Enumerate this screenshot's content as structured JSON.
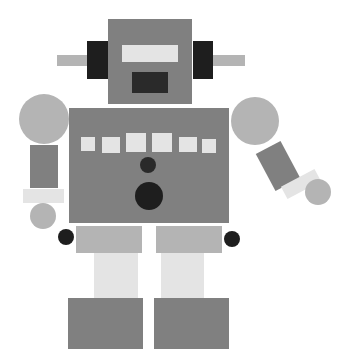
{
  "scene": {
    "subject": "robot",
    "background": "#ffffff",
    "colors": {
      "dark_gray": "#808080",
      "mid_gray": "#b4b4b4",
      "light_gray": "#e4e4e4",
      "black": "#1e1e1e"
    }
  },
  "shapes": {
    "antenna_left": {
      "x": 57,
      "y": 55,
      "w": 31,
      "h": 11,
      "color": "#b4b4b4"
    },
    "antenna_right": {
      "x": 212,
      "y": 55,
      "w": 33,
      "h": 11,
      "color": "#b4b4b4"
    },
    "ear_left": {
      "x": 87,
      "y": 41,
      "w": 21,
      "h": 38,
      "color": "#1e1e1e"
    },
    "ear_right": {
      "x": 193,
      "y": 41,
      "w": 20,
      "h": 38,
      "color": "#1e1e1e"
    },
    "head": {
      "x": 108,
      "y": 19,
      "w": 84,
      "h": 85,
      "color": "#808080"
    },
    "eye_visor": {
      "x": 122,
      "y": 45,
      "w": 56,
      "h": 17,
      "color": "#e4e4e4"
    },
    "mouth": {
      "x": 132,
      "y": 72,
      "w": 36,
      "h": 21,
      "color": "#2a2a2a"
    },
    "body": {
      "x": 69,
      "y": 108,
      "w": 160,
      "h": 115,
      "color": "#808080"
    },
    "buttons": [
      {
        "x": 81,
        "y": 137,
        "w": 14,
        "h": 14,
        "color": "#e4e4e4"
      },
      {
        "x": 102,
        "y": 137,
        "w": 18,
        "h": 16,
        "color": "#e4e4e4"
      },
      {
        "x": 126,
        "y": 133,
        "w": 20,
        "h": 19,
        "color": "#e4e4e4"
      },
      {
        "x": 152,
        "y": 133,
        "w": 20,
        "h": 19,
        "color": "#e4e4e4"
      },
      {
        "x": 179,
        "y": 137,
        "w": 18,
        "h": 15,
        "color": "#e4e4e4"
      },
      {
        "x": 202,
        "y": 139,
        "w": 14,
        "h": 14,
        "color": "#e4e4e4"
      }
    ],
    "chest_dot_small": {
      "cx": 148,
      "cy": 165,
      "r": 8,
      "color": "#2a2a2a"
    },
    "chest_dot_large": {
      "cx": 149,
      "cy": 196,
      "r": 14,
      "color": "#1e1e1e"
    },
    "shoulder_left": {
      "cx": 44,
      "cy": 119,
      "r": 25,
      "color": "#b4b4b4"
    },
    "arm_left": {
      "x": 30,
      "y": 145,
      "w": 28,
      "h": 43,
      "color": "#808080"
    },
    "wrist_left": {
      "x": 23,
      "y": 189,
      "w": 41,
      "h": 14,
      "color": "#e4e4e4"
    },
    "hand_left": {
      "cx": 43,
      "cy": 216,
      "r": 13,
      "color": "#b4b4b4"
    },
    "shoulder_right": {
      "cx": 255,
      "cy": 121,
      "r": 24,
      "color": "#b4b4b4"
    },
    "arm_right": {
      "cx": 278,
      "cy": 166,
      "w": 28,
      "h": 42,
      "rotate": -28,
      "color": "#808080"
    },
    "wrist_right": {
      "cx": 301,
      "cy": 184,
      "w": 38,
      "h": 14,
      "rotate": -28,
      "color": "#e4e4e4"
    },
    "hand_right": {
      "cx": 318,
      "cy": 192,
      "r": 13,
      "color": "#b4b4b4"
    },
    "knee_left": {
      "cx": 66,
      "cy": 237,
      "r": 8,
      "color": "#1e1e1e"
    },
    "knee_right": {
      "cx": 232,
      "cy": 239,
      "r": 8,
      "color": "#1e1e1e"
    },
    "thigh_left": {
      "x": 76,
      "y": 226,
      "w": 66,
      "h": 27,
      "color": "#b4b4b4"
    },
    "thigh_right": {
      "x": 156,
      "y": 226,
      "w": 66,
      "h": 27,
      "color": "#b4b4b4"
    },
    "shin_left": {
      "x": 94,
      "y": 253,
      "w": 44,
      "h": 46,
      "color": "#e4e4e4"
    },
    "shin_right": {
      "x": 161,
      "y": 253,
      "w": 43,
      "h": 46,
      "color": "#e4e4e4"
    },
    "foot_left": {
      "x": 68,
      "y": 298,
      "w": 75,
      "h": 51,
      "color": "#808080"
    },
    "foot_right": {
      "x": 154,
      "y": 298,
      "w": 75,
      "h": 51,
      "color": "#808080"
    }
  }
}
